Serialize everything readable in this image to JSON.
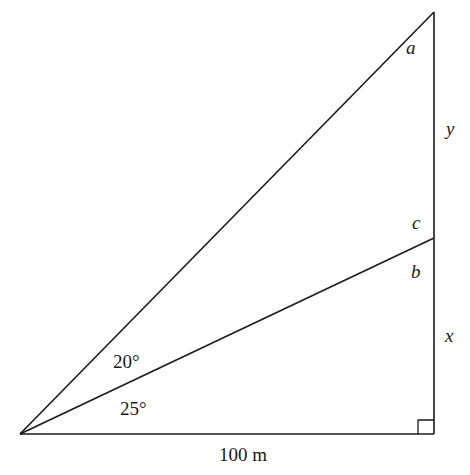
{
  "diagram": {
    "type": "right-triangle-geometry",
    "stroke_color": "#1a1a1a",
    "background": "#ffffff",
    "vertices": {
      "origin": {
        "x": 20,
        "y": 434
      },
      "right_angle": {
        "x": 434,
        "y": 434
      },
      "mid_point": {
        "x": 434,
        "y": 238
      },
      "top": {
        "x": 434,
        "y": 12
      }
    },
    "labels": {
      "a": "a",
      "y": "y",
      "c": "c",
      "b": "b",
      "x": "x",
      "angle_upper": "20°",
      "angle_lower": "25°",
      "base": "100 m"
    }
  }
}
